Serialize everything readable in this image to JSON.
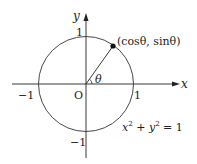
{
  "diagram": {
    "axes": {
      "x_label": "x",
      "y_label": "y",
      "origin_label": "O"
    },
    "ticks": {
      "x_pos": "1",
      "x_neg": "−1",
      "y_pos": "1",
      "y_neg": "−1"
    },
    "point_label": "(cosθ, sinθ)",
    "angle_label": "θ",
    "equation": {
      "x": "x",
      "sup1": "2",
      "plus": " + ",
      "y": "y",
      "sup2": "2",
      "eq": " = 1"
    },
    "colors": {
      "stroke": "#222222",
      "background": "#ffffff"
    }
  }
}
